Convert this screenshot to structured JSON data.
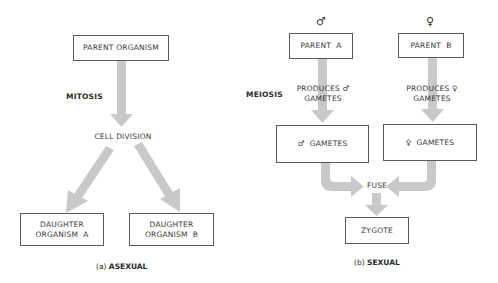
{
  "asexual": {
    "parent": "PARENT ORGANISM",
    "process": "MITOSIS",
    "division": "CELL DIVISION",
    "daughter_a_line1": "DAUGHTER",
    "daughter_a_line2": "ORGANISM  A",
    "daughter_b_line1": "DAUGHTER",
    "daughter_b_line2": "ORGANISM  B",
    "caption_letter": "(a)",
    "caption_title": "ASEXUAL"
  },
  "sexual": {
    "male_symbol": "♂",
    "female_symbol": "♀",
    "parent_a": "PARENT  A",
    "parent_b": "PARENT  B",
    "process": "MEIOSIS",
    "produces_male_line1": "PRODUCES ♂",
    "produces_male_line2": "GAMETES",
    "produces_female_line1": "PRODUCES ♀",
    "produces_female_line2": "GAMETES",
    "male_gametes": "♂  GAMETES",
    "female_gametes": "♀  GAMETES",
    "fuse": "FUSE",
    "zygote": "ZYGOTE",
    "caption_letter": "(b)",
    "caption_title": "SEXUAL"
  },
  "colors": {
    "arrow": "#c9c9c9",
    "box_border": "#5a5a5a",
    "text": "#3a3a3a"
  }
}
